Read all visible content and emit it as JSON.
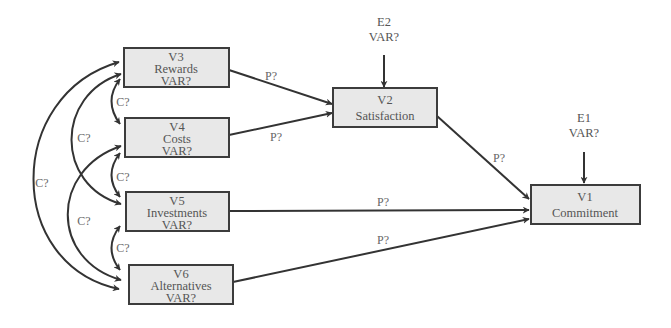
{
  "colors": {
    "box_fill": "#e8e8e8",
    "box_stroke": "#3c3c3c",
    "edge": "#333333",
    "text": "#555555"
  },
  "nodes": {
    "v1": {
      "id": "V1",
      "name": "Commitment"
    },
    "v2": {
      "id": "V2",
      "name": "Satisfaction"
    },
    "v3": {
      "id": "V3",
      "name": "Rewards",
      "var": "VAR?"
    },
    "v4": {
      "id": "V4",
      "name": "Costs",
      "var": "VAR?"
    },
    "v5": {
      "id": "V5",
      "name": "Investments",
      "var": "VAR?"
    },
    "v6": {
      "id": "V6",
      "name": "Alternatives",
      "var": "VAR?"
    }
  },
  "errors": {
    "e1": {
      "id": "E1",
      "var": "VAR?",
      "target": "V1"
    },
    "e2": {
      "id": "E2",
      "var": "VAR?",
      "target": "V2"
    }
  },
  "paths": [
    {
      "from": "V3",
      "to": "V2",
      "label": "P?"
    },
    {
      "from": "V4",
      "to": "V2",
      "label": "P?"
    },
    {
      "from": "V2",
      "to": "V1",
      "label": "P?"
    },
    {
      "from": "V5",
      "to": "V1",
      "label": "P?"
    },
    {
      "from": "V6",
      "to": "V1",
      "label": "P?"
    }
  ],
  "covariances": [
    {
      "between": [
        "V3",
        "V4"
      ],
      "label": "C?"
    },
    {
      "between": [
        "V4",
        "V5"
      ],
      "label": "C?"
    },
    {
      "between": [
        "V5",
        "V6"
      ],
      "label": "C?"
    },
    {
      "between": [
        "V3",
        "V5"
      ],
      "label": "C?"
    },
    {
      "between": [
        "V4",
        "V6"
      ],
      "label": "C?"
    },
    {
      "between": [
        "V3",
        "V6"
      ],
      "label": "C?"
    }
  ]
}
